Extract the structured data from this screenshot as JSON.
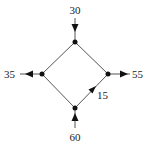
{
  "diagram": {
    "type": "network-flow",
    "nodes": [
      {
        "id": "top",
        "x": 75,
        "y": 42
      },
      {
        "id": "left",
        "x": 42,
        "y": 74
      },
      {
        "id": "right",
        "x": 108,
        "y": 74
      },
      {
        "id": "bottom",
        "x": 75,
        "y": 108
      }
    ],
    "edges": [
      {
        "from": "top",
        "to": "left"
      },
      {
        "from": "top",
        "to": "right"
      },
      {
        "from": "left",
        "to": "bottom"
      },
      {
        "from": "bottom",
        "to": "right",
        "label": "15",
        "directed": true
      }
    ],
    "external_flows": [
      {
        "node": "top",
        "direction": "in",
        "label": "30"
      },
      {
        "node": "left",
        "direction": "out",
        "label": "35"
      },
      {
        "node": "right",
        "direction": "out",
        "label": "55"
      },
      {
        "node": "bottom",
        "direction": "in",
        "label": "60"
      }
    ],
    "labels": {
      "top_in": "30",
      "left_out": "35",
      "right_out": "55",
      "bottom_in": "60",
      "edge_bottom_right": "15"
    },
    "colors": {
      "line": "#555555",
      "node": "#111111",
      "text": "#222222"
    }
  }
}
